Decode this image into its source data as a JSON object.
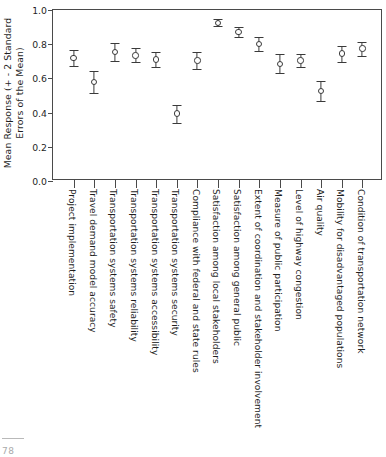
{
  "chart_data": {
    "type": "scatter",
    "title": "",
    "xlabel": "",
    "ylabel": "Mean Response (+ - 2 Standard Errors of the Mean)",
    "ylabel_line1": "Mean Response (+ - 2 Standard",
    "ylabel_line2": "Errors of the Mean)",
    "ylim": [
      0.0,
      1.0
    ],
    "yticks": [
      "0.0",
      "0.2",
      "0.4",
      "0.6",
      "0.8",
      "1.0"
    ],
    "ytick_values": [
      0.0,
      0.2,
      0.4,
      0.6,
      0.8,
      1.0
    ],
    "grid": false,
    "legend": "none",
    "error_bars": "+/- 2 standard errors of the mean",
    "categories": [
      "Project implementation",
      "Travel demand model accuracy",
      "Transportation systems safety",
      "Transportation systems reliability",
      "Transportation systems accessibility",
      "Transportation systems security",
      "Compliance with federal and state rules",
      "Satisfaction among local stakeholders",
      "Satisfaction among general public",
      "Extent of coordination and stakeholder involvement",
      "Measure of public participation",
      "Level of highway congestion",
      "Air quality",
      "Mobility for disadvantaged populations",
      "Condition of transportation network"
    ],
    "values": [
      0.72,
      0.58,
      0.755,
      0.735,
      0.71,
      0.395,
      0.705,
      0.925,
      0.87,
      0.8,
      0.685,
      0.705,
      0.525,
      0.745,
      0.775
    ],
    "err_low": [
      0.675,
      0.515,
      0.7,
      0.695,
      0.665,
      0.34,
      0.655,
      0.905,
      0.84,
      0.76,
      0.63,
      0.665,
      0.465,
      0.695,
      0.73
    ],
    "err_high": [
      0.765,
      0.645,
      0.805,
      0.775,
      0.755,
      0.445,
      0.755,
      0.945,
      0.9,
      0.84,
      0.74,
      0.745,
      0.585,
      0.79,
      0.815
    ],
    "marker": "open-circle",
    "marker_color": "#3a3a3a",
    "axis_color": "#4a4a4a"
  },
  "page": {
    "artifact_number": "78"
  }
}
